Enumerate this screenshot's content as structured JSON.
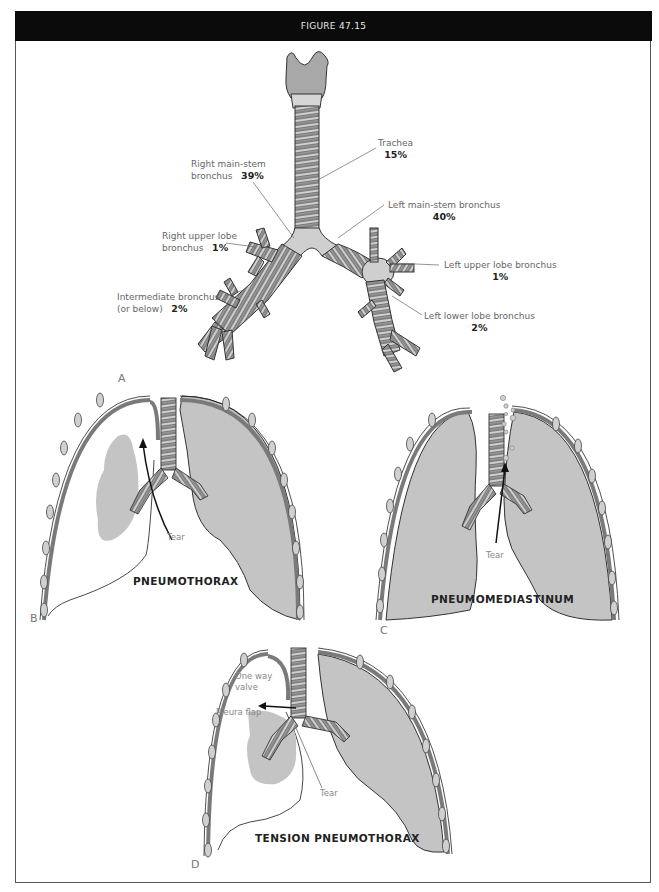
{
  "figure": {
    "title": "FIGURE 47.15"
  },
  "panel_a": {
    "letter": "A",
    "labels": [
      {
        "name": "Trachea",
        "pct": "15%"
      },
      {
        "name_line1": "Right main-stem",
        "name_line2": "bronchus",
        "pct": "39%"
      },
      {
        "name": "Left main-stem bronchus",
        "pct": "40%"
      },
      {
        "name_line1": "Right upper lobe",
        "name_line2": "bronchus",
        "pct": "1%"
      },
      {
        "name": "Left upper lobe bronchus",
        "pct": "1%"
      },
      {
        "name_line1": "Intermediate bronchus",
        "name_line2": "(or below)",
        "pct": "2%"
      },
      {
        "name": "Left lower lobe bronchus",
        "pct": "2%"
      }
    ]
  },
  "panel_b": {
    "letter": "B",
    "title": "PNEUMOTHORAX",
    "tear": "Tear"
  },
  "panel_c": {
    "letter": "C",
    "title": "PNEUMOMEDIASTINUM",
    "tear": "Tear"
  },
  "panel_d": {
    "letter": "D",
    "title": "TENSION PNEUMOTHORAX",
    "tear": "Tear",
    "valve_line1": "One way",
    "valve_line2": "valve",
    "flap": "Pleura flap"
  },
  "colors": {
    "header_bg": "#0b0b0b",
    "lung_fill": "#c4c4c4",
    "pleura": "#7a7a7a",
    "airway": "#9a9a9a",
    "airway_light": "#cfcfcf"
  }
}
